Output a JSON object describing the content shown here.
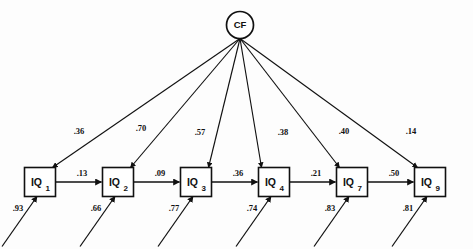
{
  "figure": {
    "type": "path-diagram",
    "background_color": "#fdfdfd",
    "line_color": "#111111"
  },
  "factor": {
    "id": "CF",
    "label": "CF",
    "shape": "circle",
    "cx": 240,
    "cy": 25,
    "r": 13.5
  },
  "indicators": [
    {
      "label": "IQ",
      "subscript": "1",
      "cx": 40,
      "cy": 182
    },
    {
      "label": "IQ",
      "subscript": "2",
      "cx": 118,
      "cy": 182
    },
    {
      "label": "IQ",
      "subscript": "3",
      "cx": 196,
      "cy": 182
    },
    {
      "label": "IQ",
      "subscript": "4",
      "cx": 274,
      "cy": 182
    },
    {
      "label": "IQ",
      "subscript": "7",
      "cx": 352,
      "cy": 182
    },
    {
      "label": "IQ",
      "subscript": "9",
      "cx": 430,
      "cy": 182
    }
  ],
  "loadings": [
    {
      "from": "CF",
      "to": "IQ1",
      "value": ".36",
      "lx": 79,
      "ly": 134
    },
    {
      "from": "CF",
      "to": "IQ2",
      "value": ".70",
      "lx": 141,
      "ly": 131
    },
    {
      "from": "CF",
      "to": "IQ3",
      "value": ".57",
      "lx": 200,
      "ly": 135
    },
    {
      "from": "CF",
      "to": "IQ4",
      "value": ".38",
      "lx": 283,
      "ly": 135
    },
    {
      "from": "CF",
      "to": "IQ7",
      "value": ".40",
      "lx": 344,
      "ly": 134
    },
    {
      "from": "CF",
      "to": "IQ9",
      "value": ".14",
      "lx": 411,
      "ly": 134
    }
  ],
  "chain_paths": [
    {
      "from": "IQ1",
      "to": "IQ2",
      "value": ".13",
      "lx": 82,
      "ly": 176
    },
    {
      "from": "IQ2",
      "to": "IQ3",
      "value": ".09",
      "lx": 160,
      "ly": 176
    },
    {
      "from": "IQ3",
      "to": "IQ4",
      "value": ".36",
      "lx": 238,
      "ly": 176
    },
    {
      "from": "IQ4",
      "to": "IQ7",
      "value": ".21",
      "lx": 316,
      "ly": 176
    },
    {
      "from": "IQ7",
      "to": "IQ9",
      "value": ".50",
      "lx": 394,
      "ly": 176
    }
  ],
  "residuals": [
    {
      "to": "IQ1",
      "value": ".93",
      "lx": 18,
      "ly": 211
    },
    {
      "to": "IQ2",
      "value": ".66",
      "lx": 96,
      "ly": 211
    },
    {
      "to": "IQ3",
      "value": ".77",
      "lx": 174,
      "ly": 211
    },
    {
      "to": "IQ4",
      "value": ".74",
      "lx": 252,
      "ly": 211
    },
    {
      "to": "IQ7",
      "value": ".83",
      "lx": 330,
      "ly": 211
    },
    {
      "to": "IQ9",
      "value": ".81",
      "lx": 408,
      "ly": 211
    }
  ],
  "chart_data": {
    "type": "diagram",
    "title": "",
    "latent_variable": "CF",
    "observed_variables": [
      "IQ1",
      "IQ2",
      "IQ3",
      "IQ4",
      "IQ7",
      "IQ9"
    ],
    "factor_loadings": {
      "IQ1": 0.36,
      "IQ2": 0.7,
      "IQ3": 0.57,
      "IQ4": 0.38,
      "IQ7": 0.4,
      "IQ9": 0.14
    },
    "autoregressive_paths": {
      "IQ1->IQ2": 0.13,
      "IQ2->IQ3": 0.09,
      "IQ3->IQ4": 0.36,
      "IQ4->IQ7": 0.21,
      "IQ7->IQ9": 0.5
    },
    "residual_paths": {
      "IQ1": 0.93,
      "IQ2": 0.66,
      "IQ3": 0.77,
      "IQ4": 0.74,
      "IQ7": 0.83,
      "IQ9": 0.81
    }
  }
}
